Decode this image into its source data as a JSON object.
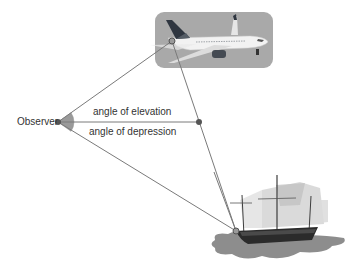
{
  "diagram": {
    "observer_label": "Observer",
    "elevation_label": "angle of elevation",
    "depression_label": "angle of depression",
    "points": {
      "observer": {
        "x": 58,
        "y": 122
      },
      "plane": {
        "x": 172,
        "y": 41
      },
      "horizontal": {
        "x": 199,
        "y": 122
      },
      "ship": {
        "x": 236,
        "y": 231
      }
    },
    "icons": [
      "airplane-icon",
      "ship-icon"
    ],
    "colors": {
      "line": "#7a7a7a",
      "dot": "#555555",
      "angle_fill": "#9a9a9a",
      "plane_box": "#a9a9a9",
      "text": "#333333"
    }
  }
}
